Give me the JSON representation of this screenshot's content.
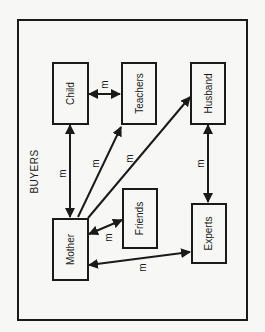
{
  "diagram": {
    "title": "BUYERS",
    "nodes": {
      "child": "Child",
      "teachers": "Teachers",
      "husband": "Husband",
      "mother": "Mother",
      "friends": "Friends",
      "experts": "Experts"
    },
    "edge_label": "m",
    "edges": [
      {
        "from": "Child",
        "to": "Teachers",
        "label": "m",
        "direction": "both"
      },
      {
        "from": "Mother",
        "to": "Child",
        "label": "m",
        "direction": "both"
      },
      {
        "from": "Mother",
        "to": "Teachers",
        "label": "m",
        "direction": "to"
      },
      {
        "from": "Mother",
        "to": "Husband",
        "label": "m",
        "direction": "to"
      },
      {
        "from": "Mother",
        "to": "Friends",
        "label": "m",
        "direction": "both"
      },
      {
        "from": "Mother",
        "to": "Experts",
        "label": "m",
        "direction": "both"
      },
      {
        "from": "Husband",
        "to": "Experts",
        "label": "m",
        "direction": "both"
      }
    ]
  }
}
